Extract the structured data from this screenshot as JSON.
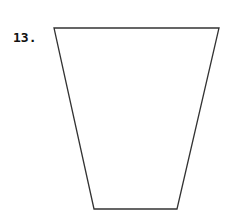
{
  "problem": {
    "number_label": "13."
  },
  "figure": {
    "shape": "trapezoid",
    "stroke_color": "#333333",
    "fill_color": "#ffffff",
    "vertices": {
      "top_left": [
        54,
        28
      ],
      "top_right": [
        219,
        28
      ],
      "bottom_right": [
        177,
        209
      ],
      "bottom_left": [
        94,
        209
      ]
    }
  }
}
